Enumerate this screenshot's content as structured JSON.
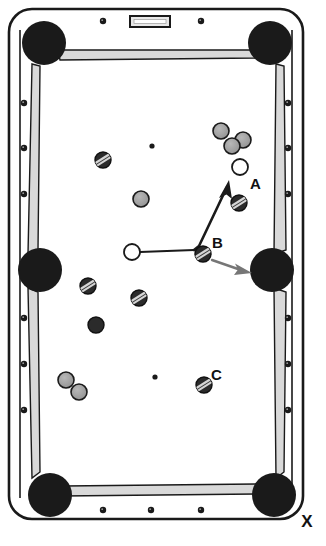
{
  "figure": {
    "axis_label_x": "X",
    "caption": ""
  },
  "colors": {
    "cloth": "#ffffff",
    "outline": "#1a1a1a",
    "rail_fill": "#d9d9d9",
    "rail_edge": "#8a8a8a",
    "pocket": "#1a1a1a",
    "diamond": "#1a1a1a",
    "ball_solid_gray": "#9e9e9e",
    "ball_stripe_gray": "#8c8c8c",
    "ball_dark": "#2b2b2b",
    "ball_cue": "#ffffff",
    "arrow": "#1a1a1a",
    "arrow_gray": "#767676"
  },
  "table": {
    "name": "pool-table",
    "outer": {
      "x": 8,
      "y": 8,
      "width": 296,
      "height": 512,
      "radius": 22
    },
    "cloth": {
      "x": 22,
      "y": 28,
      "width": 268,
      "height": 472
    },
    "plaque": {
      "x": 130,
      "y": 16,
      "width": 40,
      "height": 11
    }
  },
  "pockets": [
    {
      "name": "pocket-top-left",
      "cx": 44,
      "cy": 43,
      "r": 22
    },
    {
      "name": "pocket-top-right",
      "cx": 270,
      "cy": 43,
      "r": 22
    },
    {
      "name": "pocket-middle-left",
      "cx": 40,
      "cy": 270,
      "r": 22
    },
    {
      "name": "pocket-middle-right",
      "cx": 272,
      "cy": 270,
      "r": 22
    },
    {
      "name": "pocket-bottom-left",
      "cx": 50,
      "cy": 495,
      "r": 22
    },
    {
      "name": "pocket-bottom-right",
      "cx": 274,
      "cy": 495,
      "r": 22
    }
  ],
  "diamonds": [
    {
      "name": "diamond-top-1",
      "cx": 103,
      "cy": 21,
      "r": 3.2
    },
    {
      "name": "diamond-top-2",
      "cx": 201,
      "cy": 21,
      "r": 3.2
    },
    {
      "name": "diamond-bottom-1",
      "cx": 103,
      "cy": 510,
      "r": 3.2
    },
    {
      "name": "diamond-bottom-2",
      "cx": 151,
      "cy": 510,
      "r": 3.2
    },
    {
      "name": "diamond-bottom-3",
      "cx": 201,
      "cy": 510,
      "r": 3.2
    },
    {
      "name": "diamond-left-1",
      "cx": 24,
      "cy": 103,
      "r": 3.2
    },
    {
      "name": "diamond-left-2",
      "cx": 24,
      "cy": 148,
      "r": 3.2
    },
    {
      "name": "diamond-left-3",
      "cx": 24,
      "cy": 194,
      "r": 3.2
    },
    {
      "name": "diamond-left-4",
      "cx": 24,
      "cy": 318,
      "r": 3.2
    },
    {
      "name": "diamond-left-5",
      "cx": 24,
      "cy": 364,
      "r": 3.2
    },
    {
      "name": "diamond-left-6",
      "cx": 24,
      "cy": 410,
      "r": 3.2
    },
    {
      "name": "diamond-right-1",
      "cx": 288,
      "cy": 103,
      "r": 3.2
    },
    {
      "name": "diamond-right-2",
      "cx": 288,
      "cy": 148,
      "r": 3.2
    },
    {
      "name": "diamond-right-3",
      "cx": 288,
      "cy": 194,
      "r": 3.2
    },
    {
      "name": "diamond-right-4",
      "cx": 288,
      "cy": 318,
      "r": 3.2
    },
    {
      "name": "diamond-right-5",
      "cx": 288,
      "cy": 364,
      "r": 3.2
    },
    {
      "name": "diamond-right-6",
      "cx": 288,
      "cy": 410,
      "r": 3.2
    }
  ],
  "spots": [
    {
      "name": "spot-center-top",
      "cx": 152,
      "cy": 146,
      "r": 2.6
    },
    {
      "name": "spot-center-bottom",
      "cx": 155,
      "cy": 377,
      "r": 2.6
    }
  ],
  "balls": [
    {
      "name": "ball-stripe-upper-left",
      "cx": 103,
      "cy": 160,
      "r": 8,
      "type": "stripe",
      "label": ""
    },
    {
      "name": "ball-solid-mid-left",
      "cx": 141,
      "cy": 199,
      "r": 8,
      "type": "solid",
      "label": ""
    },
    {
      "name": "ball-solid-cluster-1",
      "cx": 221,
      "cy": 131,
      "r": 8,
      "type": "solid",
      "label": ""
    },
    {
      "name": "ball-solid-cluster-2",
      "cx": 243,
      "cy": 140,
      "r": 8,
      "type": "solid",
      "label": ""
    },
    {
      "name": "ball-solid-cluster-3",
      "cx": 232,
      "cy": 146,
      "r": 8,
      "type": "solid",
      "label": ""
    },
    {
      "name": "ball-a-target",
      "cx": 240,
      "cy": 167,
      "r": 8,
      "type": "cue",
      "label": "A",
      "label_x": 250,
      "label_y": 189
    },
    {
      "name": "ball-stripe-right",
      "cx": 239,
      "cy": 203,
      "r": 8,
      "type": "stripe",
      "label": ""
    },
    {
      "name": "ball-cue",
      "cx": 132,
      "cy": 252,
      "r": 8,
      "type": "cue",
      "label": ""
    },
    {
      "name": "ball-b-object",
      "cx": 203,
      "cy": 254,
      "r": 8,
      "type": "stripe",
      "label": "B",
      "label_x": 212,
      "label_y": 248
    },
    {
      "name": "ball-stripe-lower-left",
      "cx": 88,
      "cy": 286,
      "r": 8,
      "type": "stripe",
      "label": ""
    },
    {
      "name": "ball-stripe-lower-mid",
      "cx": 139,
      "cy": 298,
      "r": 8,
      "type": "stripe",
      "label": ""
    },
    {
      "name": "ball-eight-dark",
      "cx": 96,
      "cy": 325,
      "r": 8,
      "type": "dark",
      "label": ""
    },
    {
      "name": "ball-solid-bottom-1",
      "cx": 66,
      "cy": 380,
      "r": 8,
      "type": "solid",
      "label": ""
    },
    {
      "name": "ball-solid-bottom-2",
      "cx": 79,
      "cy": 392,
      "r": 8,
      "type": "solid",
      "label": ""
    },
    {
      "name": "ball-c-object",
      "cx": 204,
      "cy": 385,
      "r": 8,
      "type": "stripe",
      "label": "C",
      "label_x": 211,
      "label_y": 380
    }
  ],
  "shot_paths": [
    {
      "name": "cue-to-b-path",
      "points": "140,252 194,250",
      "style": "solid-thin",
      "arrow": false
    },
    {
      "name": "deflection-path-to-a",
      "points": "194,250 200,245 228,185",
      "style": "solid-thick",
      "arrow": true,
      "arrow_tip": {
        "x": 229,
        "y": 182
      }
    },
    {
      "name": "b-travel-arrow",
      "points": "212,259 245,271",
      "style": "gray",
      "arrow": true,
      "arrow_tip": {
        "x": 248,
        "y": 272
      }
    }
  ],
  "annotations": {
    "label_a": "A",
    "label_b": "B",
    "label_c": "C",
    "label_x_axis": "X"
  }
}
